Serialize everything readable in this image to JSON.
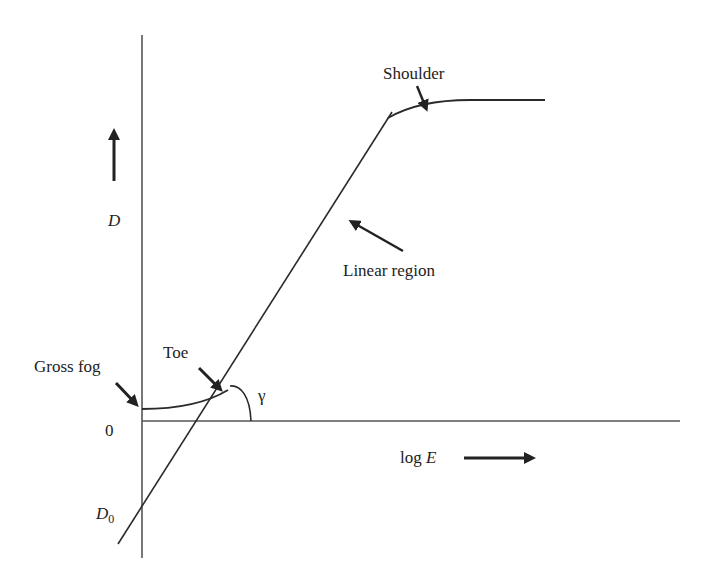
{
  "diagram": {
    "labels": {
      "y_axis": "D",
      "x_axis_prefix": "log ",
      "x_axis_var": "E",
      "origin": "0",
      "d0_main": "D",
      "d0_sub": "0",
      "gross_fog": "Gross fog",
      "toe": "Toe",
      "gamma": "γ",
      "linear_region": "Linear region",
      "shoulder": "Shoulder"
    },
    "regions": [
      "Gross fog",
      "Toe",
      "Linear region",
      "Shoulder"
    ],
    "colors": {
      "line": "#2a2a2a",
      "axis": "#555555",
      "arrow": "#222222"
    }
  }
}
